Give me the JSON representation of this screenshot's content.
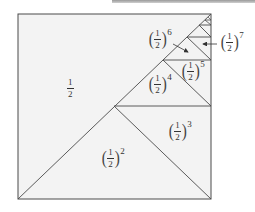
{
  "diagram": {
    "colors": {
      "fill": "#f3f3f3",
      "stroke": "#4a4a4a",
      "text": "#333333",
      "topbar": "#a8a8a8"
    },
    "labels": [
      {
        "id": "half",
        "numerator": "1",
        "denominator": "2",
        "exponent": ""
      },
      {
        "id": "pow2",
        "numerator": "1",
        "denominator": "2",
        "exponent": "2"
      },
      {
        "id": "pow3",
        "numerator": "1",
        "denominator": "2",
        "exponent": "3"
      },
      {
        "id": "pow4",
        "numerator": "1",
        "denominator": "2",
        "exponent": "4"
      },
      {
        "id": "pow5",
        "numerator": "1",
        "denominator": "2",
        "exponent": "5"
      },
      {
        "id": "pow6",
        "numerator": "1",
        "denominator": "2",
        "exponent": "6"
      },
      {
        "id": "pow7",
        "numerator": "1",
        "denominator": "2",
        "exponent": "7"
      }
    ],
    "paren_left": "(",
    "paren_right": ")"
  }
}
